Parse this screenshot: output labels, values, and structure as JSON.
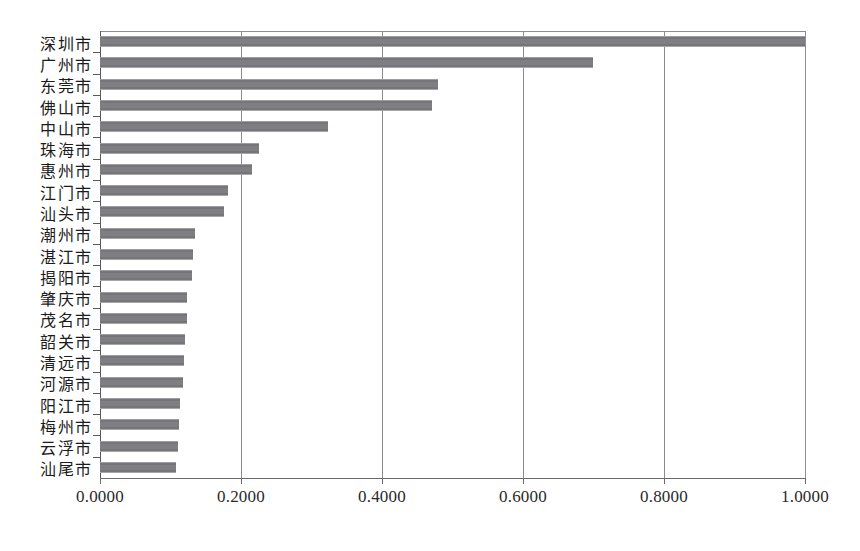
{
  "chart_data": {
    "type": "bar",
    "orientation": "horizontal",
    "title": "",
    "subtitle": "",
    "xlabel": "",
    "ylabel": "",
    "xlim": [
      0.0,
      1.0
    ],
    "grid": true,
    "legend": null,
    "xticks": [
      "0.0000",
      "0.2000",
      "0.4000",
      "0.6000",
      "0.8000",
      "1.0000"
    ],
    "xtick_values": [
      0.0,
      0.2,
      0.4,
      0.6,
      0.8,
      1.0
    ],
    "categories": [
      "深圳市",
      "广州市",
      "东莞市",
      "佛山市",
      "中山市",
      "珠海市",
      "惠州市",
      "江门市",
      "汕头市",
      "潮州市",
      "湛江市",
      "揭阳市",
      "肇庆市",
      "茂名市",
      "韶关市",
      "清远市",
      "河源市",
      "阳江市",
      "梅州市",
      "云浮市",
      "汕尾市"
    ],
    "values": [
      1.0,
      0.7,
      0.479,
      0.471,
      0.324,
      0.225,
      0.216,
      0.181,
      0.176,
      0.135,
      0.132,
      0.13,
      0.124,
      0.123,
      0.12,
      0.119,
      0.118,
      0.114,
      0.112,
      0.11,
      0.108
    ],
    "colors": {
      "bar": "#7f7f83",
      "axis": "#59595c",
      "grid": "#8a8a8d",
      "text": "#1b1b1b",
      "background": "#ffffff"
    }
  }
}
